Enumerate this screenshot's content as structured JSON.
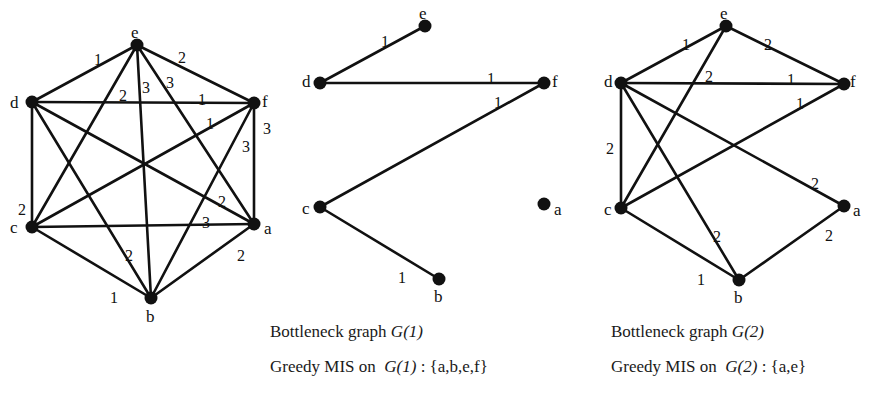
{
  "colors": {
    "ink": "#111111",
    "background": "#ffffff"
  },
  "graphs": [
    {
      "id": "G",
      "nodes": [
        {
          "id": "e",
          "x": 137,
          "y": 45,
          "lx": 131,
          "ly": 38
        },
        {
          "id": "d",
          "x": 32,
          "y": 102,
          "lx": 10,
          "ly": 108
        },
        {
          "id": "f",
          "x": 254,
          "y": 103,
          "lx": 262,
          "ly": 107
        },
        {
          "id": "c",
          "x": 32,
          "y": 227,
          "lx": 10,
          "ly": 233
        },
        {
          "id": "a",
          "x": 254,
          "y": 224,
          "lx": 264,
          "ly": 234
        },
        {
          "id": "b",
          "x": 151,
          "y": 298,
          "lx": 146,
          "ly": 322
        }
      ],
      "edges": [
        {
          "u": "d",
          "v": "e",
          "w": "1",
          "lx": 94,
          "ly": 60
        },
        {
          "u": "c",
          "v": "e",
          "w": "2",
          "lx": 119,
          "ly": 96
        },
        {
          "u": "b",
          "v": "e",
          "w": "3",
          "lx": 142,
          "ly": 88
        },
        {
          "u": "a",
          "v": "e",
          "w": "3",
          "lx": 166,
          "ly": 83
        },
        {
          "u": "e",
          "v": "f",
          "w": "2",
          "lx": 178,
          "ly": 58
        },
        {
          "u": "d",
          "v": "f",
          "w": "1",
          "lx": 198,
          "ly": 100
        },
        {
          "u": "c",
          "v": "f",
          "w": "1",
          "lx": 206,
          "ly": 124
        },
        {
          "u": "b",
          "v": "f",
          "w": "3",
          "lx": 242,
          "ly": 147
        },
        {
          "u": "a",
          "v": "f",
          "w": "3",
          "lx": 263,
          "ly": 129
        },
        {
          "u": "d",
          "v": "c",
          "w": "2",
          "lx": 18,
          "ly": 210
        },
        {
          "u": "d",
          "v": "a",
          "w": "2",
          "lx": 218,
          "ly": 202
        },
        {
          "u": "d",
          "v": "b",
          "w": "2",
          "lx": 125,
          "ly": 256
        },
        {
          "u": "c",
          "v": "a",
          "w": "3",
          "lx": 202,
          "ly": 223
        },
        {
          "u": "c",
          "v": "b",
          "w": "1",
          "lx": 110,
          "ly": 298
        },
        {
          "u": "a",
          "v": "b",
          "w": "2",
          "lx": 237,
          "ly": 256
        }
      ]
    },
    {
      "id": "G1",
      "nodes": [
        {
          "id": "e",
          "x": 425,
          "y": 26,
          "lx": 419,
          "ly": 19
        },
        {
          "id": "d",
          "x": 320,
          "y": 83,
          "lx": 302,
          "ly": 87
        },
        {
          "id": "f",
          "x": 544,
          "y": 83,
          "lx": 552,
          "ly": 87
        },
        {
          "id": "c",
          "x": 320,
          "y": 207,
          "lx": 302,
          "ly": 214
        },
        {
          "id": "a",
          "x": 544,
          "y": 204,
          "lx": 554,
          "ly": 215
        },
        {
          "id": "b",
          "x": 439,
          "y": 279,
          "lx": 434,
          "ly": 302
        }
      ],
      "edges": [
        {
          "u": "d",
          "v": "e",
          "w": "1",
          "lx": 381,
          "ly": 42
        },
        {
          "u": "d",
          "v": "f",
          "w": "1",
          "lx": 487,
          "ly": 79
        },
        {
          "u": "c",
          "v": "f",
          "w": "1",
          "lx": 494,
          "ly": 103
        },
        {
          "u": "c",
          "v": "b",
          "w": "1",
          "lx": 398,
          "ly": 278
        }
      ]
    },
    {
      "id": "G2",
      "nodes": [
        {
          "id": "e",
          "x": 726,
          "y": 26,
          "lx": 720,
          "ly": 19
        },
        {
          "id": "d",
          "x": 621,
          "y": 83,
          "lx": 604,
          "ly": 87
        },
        {
          "id": "f",
          "x": 844,
          "y": 84,
          "lx": 850,
          "ly": 87
        },
        {
          "id": "c",
          "x": 621,
          "y": 208,
          "lx": 604,
          "ly": 215
        },
        {
          "id": "a",
          "x": 844,
          "y": 206,
          "lx": 853,
          "ly": 216
        },
        {
          "id": "b",
          "x": 739,
          "y": 280,
          "lx": 734,
          "ly": 303
        }
      ],
      "edges": [
        {
          "u": "d",
          "v": "e",
          "w": "1",
          "lx": 682,
          "ly": 45
        },
        {
          "u": "c",
          "v": "e",
          "w": "2",
          "lx": 705,
          "ly": 77
        },
        {
          "u": "e",
          "v": "f",
          "w": "2",
          "lx": 764,
          "ly": 45
        },
        {
          "u": "d",
          "v": "f",
          "w": "1",
          "lx": 787,
          "ly": 80
        },
        {
          "u": "c",
          "v": "f",
          "w": "1",
          "lx": 796,
          "ly": 104
        },
        {
          "u": "d",
          "v": "c",
          "w": "2",
          "lx": 606,
          "ly": 149
        },
        {
          "u": "d",
          "v": "a",
          "w": "2",
          "lx": 811,
          "ly": 184
        },
        {
          "u": "d",
          "v": "b",
          "w": "2",
          "lx": 713,
          "ly": 237
        },
        {
          "u": "c",
          "v": "b",
          "w": "1",
          "lx": 697,
          "ly": 280
        },
        {
          "u": "a",
          "v": "b",
          "w": "2",
          "lx": 825,
          "ly": 236
        }
      ]
    }
  ],
  "captions": {
    "g1_title_prefix": "Bottleneck graph ",
    "g1_title_symbol": "G(1)",
    "g1_mis_prefix": "Greedy MIS on  ",
    "g1_mis_symbol": "G(1)",
    "g1_mis_suffix": " : {a,b,e,f}",
    "g2_title_prefix": "Bottleneck graph ",
    "g2_title_symbol": "G(2)",
    "g2_mis_prefix": "Greedy MIS on  ",
    "g2_mis_symbol": "G(2)",
    "g2_mis_suffix": " : {a,e}"
  }
}
